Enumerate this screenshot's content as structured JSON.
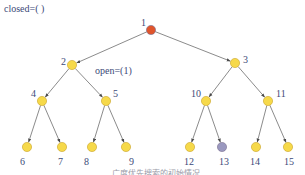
{
  "diagram": {
    "type": "search-tree",
    "closed_label": "closed=( )",
    "open_label": "open=(1)",
    "caption": "广度优先搜索的初始情况",
    "colors": {
      "expanded": "#e0552c",
      "frontier": "#f6d94a",
      "goal": "#9a98bf",
      "node_stroke": "#c9a227",
      "edge": "#6d6d6d",
      "label": "#3c4a78"
    },
    "nodes": [
      {
        "id": "1",
        "label": "1",
        "x": 151,
        "y": 30,
        "state": "expanded",
        "lx": 141,
        "ly": 26
      },
      {
        "id": "2",
        "label": "2",
        "x": 72,
        "y": 65,
        "state": "frontier",
        "lx": 61,
        "ly": 65
      },
      {
        "id": "3",
        "label": "3",
        "x": 235,
        "y": 63,
        "state": "frontier",
        "lx": 243,
        "ly": 63
      },
      {
        "id": "4",
        "label": "4",
        "x": 42,
        "y": 101,
        "state": "frontier",
        "lx": 31,
        "ly": 97
      },
      {
        "id": "5",
        "label": "5",
        "x": 106,
        "y": 101,
        "state": "frontier",
        "lx": 113,
        "ly": 97
      },
      {
        "id": "10",
        "label": "10",
        "x": 206,
        "y": 101,
        "state": "frontier",
        "lx": 191,
        "ly": 97
      },
      {
        "id": "11",
        "label": "11",
        "x": 268,
        "y": 101,
        "state": "frontier",
        "lx": 276,
        "ly": 97
      },
      {
        "id": "6",
        "label": "6",
        "x": 27,
        "y": 147,
        "state": "frontier",
        "lx": 20,
        "ly": 165
      },
      {
        "id": "7",
        "label": "7",
        "x": 62,
        "y": 147,
        "state": "frontier",
        "lx": 58,
        "ly": 165
      },
      {
        "id": "8",
        "label": "8",
        "x": 92,
        "y": 147,
        "state": "frontier",
        "lx": 84,
        "ly": 165
      },
      {
        "id": "9",
        "label": "9",
        "x": 126,
        "y": 147,
        "state": "frontier",
        "lx": 129,
        "ly": 165
      },
      {
        "id": "12",
        "label": "12",
        "x": 190,
        "y": 147,
        "state": "frontier",
        "lx": 184,
        "ly": 165
      },
      {
        "id": "13",
        "label": "13",
        "x": 222,
        "y": 147,
        "state": "goal",
        "lx": 219,
        "ly": 165
      },
      {
        "id": "14",
        "label": "14",
        "x": 256,
        "y": 147,
        "state": "frontier",
        "lx": 250,
        "ly": 165
      },
      {
        "id": "15",
        "label": "15",
        "x": 288,
        "y": 147,
        "state": "frontier",
        "lx": 284,
        "ly": 165
      }
    ],
    "edges": [
      [
        "1",
        "2"
      ],
      [
        "1",
        "3"
      ],
      [
        "2",
        "4"
      ],
      [
        "2",
        "5"
      ],
      [
        "3",
        "10"
      ],
      [
        "3",
        "11"
      ],
      [
        "4",
        "6"
      ],
      [
        "4",
        "7"
      ],
      [
        "5",
        "8"
      ],
      [
        "5",
        "9"
      ],
      [
        "10",
        "12"
      ],
      [
        "10",
        "13"
      ],
      [
        "11",
        "14"
      ],
      [
        "11",
        "15"
      ]
    ]
  }
}
